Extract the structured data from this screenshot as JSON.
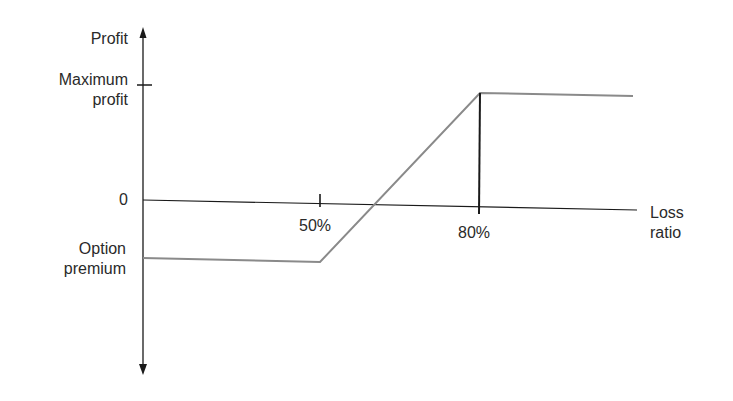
{
  "diagram": {
    "type": "option-payoff",
    "y_axis": {
      "label": "Profit",
      "ticks": [
        {
          "label_line1": "Maximum",
          "label_line2": "profit"
        },
        {
          "label": "0"
        },
        {
          "label_line1": "Option",
          "label_line2": "premium"
        }
      ]
    },
    "x_axis": {
      "label_line1": "Loss",
      "label_line2": "ratio",
      "ticks": [
        "50%",
        "80%"
      ]
    },
    "payoff_curve": {
      "description": "Flat loss equal to option premium until 50% loss ratio, rising linearly to maximum profit at 80%, flat thereafter",
      "points": [
        {
          "x": "0",
          "y": "Option premium (negative)"
        },
        {
          "x": "50%",
          "y": "Option premium (negative)"
        },
        {
          "x": "80%",
          "y": "Maximum profit"
        },
        {
          "x": "beyond",
          "y": "Maximum profit"
        }
      ]
    },
    "colors": {
      "axis": "#1a1a1a",
      "payoff_line": "#8a8a8a",
      "text": "#2a2a2a"
    }
  }
}
